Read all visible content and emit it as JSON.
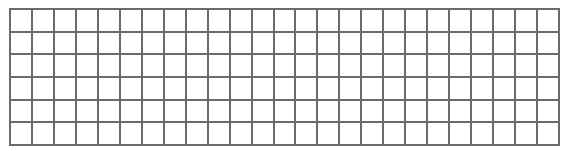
{
  "grid": {
    "rows": 6,
    "cols": 25,
    "width": 551,
    "height": 138,
    "line_color": "#6b6b6b",
    "cell_fill": "#ffffff"
  }
}
